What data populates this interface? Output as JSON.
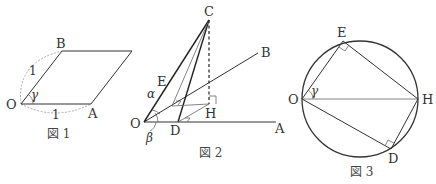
{
  "figure1": {
    "caption": "図 1",
    "labels": {
      "O": "O",
      "A": "A",
      "B": "B"
    },
    "angle_label": "γ",
    "side_OB": "1",
    "side_OA": "1"
  },
  "figure2": {
    "caption": "図 2",
    "labels": {
      "O": "O",
      "A": "A",
      "B": "B",
      "C": "C",
      "D": "D",
      "E": "E",
      "H": "H"
    },
    "angle_alpha": "α",
    "angle_beta": "β"
  },
  "figure3": {
    "caption": "図 3",
    "labels": {
      "O": "O",
      "E": "E",
      "H": "H",
      "D": "D"
    },
    "angle_label": "γ"
  }
}
